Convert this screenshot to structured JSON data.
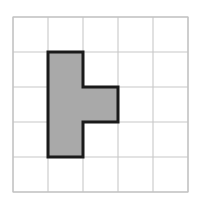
{
  "figure": {
    "background_color": "#ffffff"
  },
  "grid": {
    "name": "square-grid",
    "columns": 5,
    "rows": 5,
    "cell_size": 35,
    "origin_x": 13,
    "origin_y": 17,
    "width": 175,
    "height": 175,
    "line_color": "#c8c8c8",
    "line_width": 1.1,
    "border_color": "#c0c0c0",
    "show_grid": true
  },
  "shape": {
    "name": "shaded-l-polygon",
    "kind": "polygon",
    "fill_color": "#a9a9a9",
    "stroke_color": "#1a1a1a",
    "stroke_width": 3,
    "area_cells": 4,
    "perimeter_cells": 10,
    "description": "L-shaped hexomino-style figure: vertical bar three cells tall in column 2 with one cell extending right at the middle row",
    "cells": [
      {
        "col": 1,
        "row": 1
      },
      {
        "col": 1,
        "row": 2
      },
      {
        "col": 1,
        "row": 3
      },
      {
        "col": 2,
        "row": 2
      }
    ],
    "vertices_cells": [
      {
        "x": 1,
        "y": 1
      },
      {
        "x": 2,
        "y": 1
      },
      {
        "x": 2,
        "y": 2
      },
      {
        "x": 3,
        "y": 2
      },
      {
        "x": 3,
        "y": 3
      },
      {
        "x": 2,
        "y": 3
      },
      {
        "x": 2,
        "y": 4
      },
      {
        "x": 1,
        "y": 4
      }
    ]
  }
}
